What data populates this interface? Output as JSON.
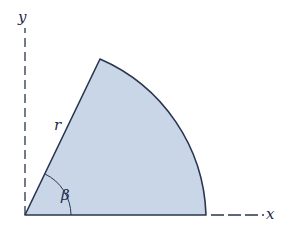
{
  "diagram": {
    "axes": {
      "x_label": "x",
      "y_label": "y"
    },
    "sector": {
      "radius_label": "r",
      "angle_label": "β",
      "fill": "#c9d6e8",
      "stroke": "#2a3550"
    },
    "colors": {
      "axis": "#2a3550",
      "label": "#1d2a4a"
    }
  }
}
